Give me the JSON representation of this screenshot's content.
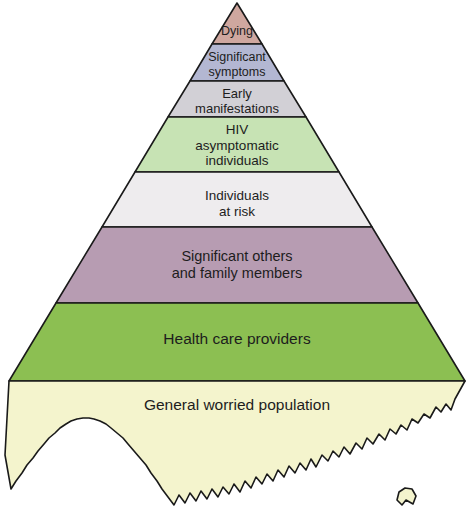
{
  "figure": {
    "type": "pyramid-diagram",
    "background_color": "#ffffff",
    "outline_color": "#1a1a1a",
    "text_color": "#1d1d1d",
    "tier_count": 8
  },
  "tiers": [
    {
      "id": "dying",
      "label": "Dying",
      "color": "#cfa79f",
      "position_from_top": 1
    },
    {
      "id": "significant-symptoms",
      "label": "Significant\nsymptoms",
      "color": "#b3b7d2",
      "position_from_top": 2
    },
    {
      "id": "early-manifestations",
      "label": "Early\nmanifestations",
      "color": "#d2d0d6",
      "position_from_top": 3
    },
    {
      "id": "hiv-asymptomatic-individuals",
      "label": "HIV\nasymptomatic\nindividuals",
      "color": "#c7e3b4",
      "position_from_top": 4
    },
    {
      "id": "individuals-at-risk",
      "label": "Individuals\nat risk",
      "color": "#eeecee",
      "position_from_top": 5
    },
    {
      "id": "significant-others-and-family-members",
      "label": "Significant others\nand family members",
      "color": "#b79cb2",
      "position_from_top": 6
    },
    {
      "id": "health-care-providers",
      "label": "Health care providers",
      "color": "#8cbf52",
      "position_from_top": 7
    },
    {
      "id": "general-worried-population",
      "label": "General worried population",
      "color": "#f4f4cd",
      "position_from_top": 8
    }
  ],
  "caption": {
    "partial_text": ""
  }
}
